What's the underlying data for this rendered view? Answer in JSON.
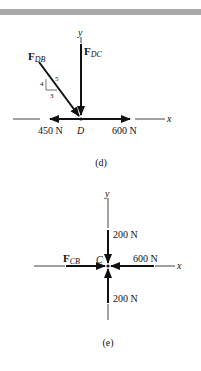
{
  "figure_d": {
    "caption": "(d)",
    "point_label": "D",
    "axis_x": "x",
    "axis_y": "y",
    "force_db": {
      "main": "F",
      "sub": "DB"
    },
    "force_dc": {
      "main": "F",
      "sub": "DC"
    },
    "force_left": "450 N",
    "force_right": "600 N",
    "slope_triangle": {
      "rise": "4",
      "run": "3",
      "hyp": "5"
    }
  },
  "figure_e": {
    "caption": "(e)",
    "point_label": "C",
    "axis_x": "x",
    "axis_y": "y",
    "force_cb": {
      "main": "F",
      "sub": "CB"
    },
    "force_top": "200 N",
    "force_right": "600 N",
    "force_bottom": "200 N"
  },
  "colors": {
    "ink": "#111111",
    "bar": "#a9a9a9"
  }
}
